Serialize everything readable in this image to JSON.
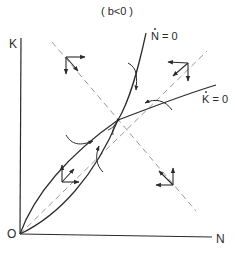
{
  "diagram": {
    "title": "( b<0 )",
    "axes": {
      "y_label": "K",
      "x_label": "N",
      "origin_label": "O"
    },
    "curves": [
      {
        "id": "n-dot-nullcline",
        "label_base": "N",
        "label_suffix": " = 0",
        "description": "Ṅ = 0 isocline"
      },
      {
        "id": "k-dot-nullcline",
        "label_base": "K",
        "label_suffix": " = 0",
        "description": "K̇ = 0 isocline"
      }
    ],
    "dashed_lines": [
      {
        "id": "ray-from-origin",
        "description": "dashed line from origin through equilibrium"
      },
      {
        "id": "saddle-path-line",
        "description": "dashed line descending through equilibrium"
      }
    ],
    "equilibrium": {
      "label": ""
    },
    "arrow_clusters": [
      {
        "region": "upper-left",
        "directions": [
          "right",
          "down",
          "down-right"
        ]
      },
      {
        "region": "upper-right",
        "directions": [
          "left",
          "down",
          "down-left"
        ]
      },
      {
        "region": "lower-left",
        "directions": [
          "up",
          "right",
          "up-right"
        ]
      },
      {
        "region": "lower-right",
        "directions": [
          "up",
          "left",
          "up-left"
        ]
      }
    ],
    "colors": {
      "line": "#2a2a2a",
      "dashed": "#9a9a9a",
      "background": "#ffffff"
    }
  }
}
